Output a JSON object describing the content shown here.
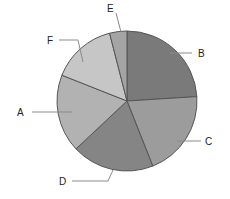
{
  "chart_data": {
    "type": "pie",
    "title": "",
    "categories": [
      "B",
      "C",
      "D",
      "A",
      "F",
      "E"
    ],
    "values": [
      24,
      20,
      19,
      18,
      15,
      4
    ],
    "colors": [
      "#7a7a7a",
      "#9c9c9c",
      "#858585",
      "#b2b2b2",
      "#c6c6c6",
      "#a4a4a4"
    ],
    "start_angle_deg": 0,
    "direction": "clockwise",
    "legend": "none (leader-line labels)",
    "labels": {
      "B": "B",
      "C": "C",
      "D": "D",
      "A": "A",
      "F": "F",
      "E": "E"
    }
  }
}
